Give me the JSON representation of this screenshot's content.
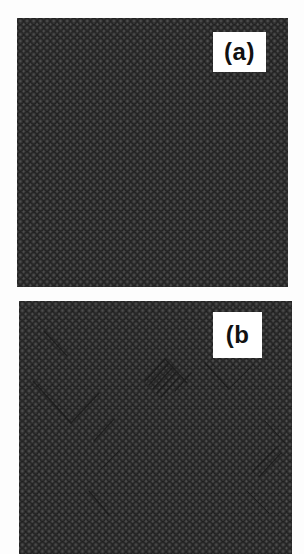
{
  "figure": {
    "panels": [
      {
        "id": "a",
        "label": "(a)",
        "description": "perfect atomic lattice, no defects"
      },
      {
        "id": "b",
        "label": "(b",
        "description": "atomic lattice with diagonal defect streaks"
      }
    ],
    "colors": {
      "atom": "#262626",
      "background": "#f2f2f2",
      "label_box": "#ffffff",
      "label_text": "#111111",
      "defect": "#1a1a1a"
    }
  }
}
